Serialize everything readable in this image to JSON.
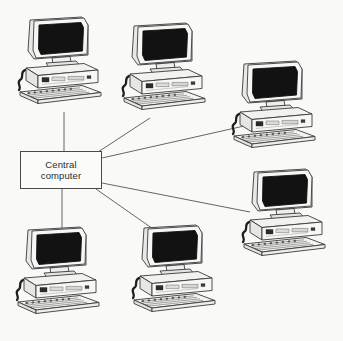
{
  "diagram": {
    "background_color": "#f9f9f7",
    "line_color": "#555555",
    "hub": {
      "label_line1": "Central",
      "label_line2": "computer",
      "border_color": "#4a4a4a",
      "fill_color": "#fbfbf9",
      "x": 20,
      "y": 151,
      "width": 82,
      "height": 38
    },
    "nodes": [
      {
        "id": "pc-top-left",
        "name": "computer-workstation",
        "x": 8,
        "y": 8
      },
      {
        "id": "pc-top-center",
        "name": "computer-workstation",
        "x": 112,
        "y": 14
      },
      {
        "id": "pc-top-right",
        "name": "computer-workstation",
        "x": 222,
        "y": 52
      },
      {
        "id": "pc-middle-right",
        "name": "computer-workstation",
        "x": 232,
        "y": 160
      },
      {
        "id": "pc-bottom-left",
        "name": "computer-workstation",
        "x": 6,
        "y": 218
      },
      {
        "id": "pc-bottom-center",
        "name": "computer-workstation",
        "x": 122,
        "y": 216
      }
    ],
    "links": [
      {
        "from": "hub",
        "to": "pc-top-left",
        "x1": 64,
        "y1": 151,
        "x2": 64,
        "y2": 112
      },
      {
        "from": "hub",
        "to": "pc-top-center",
        "x1": 98,
        "y1": 152,
        "x2": 150,
        "y2": 118
      },
      {
        "from": "hub",
        "to": "pc-top-right",
        "x1": 102,
        "y1": 158,
        "x2": 244,
        "y2": 126
      },
      {
        "from": "hub",
        "to": "pc-middle-right",
        "x1": 102,
        "y1": 183,
        "x2": 250,
        "y2": 212
      },
      {
        "from": "hub",
        "to": "pc-bottom-center",
        "x1": 96,
        "y1": 189,
        "x2": 166,
        "y2": 238
      },
      {
        "from": "hub",
        "to": "pc-bottom-left",
        "x1": 62,
        "y1": 189,
        "x2": 62,
        "y2": 246
      }
    ],
    "pc_parts": {
      "monitor": "monitor-screen",
      "case": "desktop-case",
      "keyboard": "keyboard",
      "cable": "cable",
      "screen_color": "#111111",
      "body_color": "#f2f2f0"
    }
  }
}
